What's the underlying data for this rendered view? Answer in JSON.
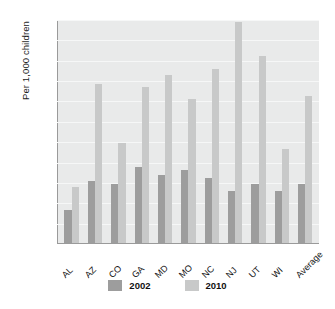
{
  "chart_data": {
    "type": "bar",
    "title": "",
    "xlabel": "",
    "ylabel": "Per 1,000 children",
    "ylim": [
      0,
      22
    ],
    "ytick_step": 2,
    "yticks": [
      "22.0",
      "20.0",
      "18.0",
      "16.0",
      "14.0",
      "12.0",
      "10.0",
      "8.0",
      "6.0",
      "4.0",
      "2.0",
      "0.0"
    ],
    "grid": true,
    "legend_position": "bottom",
    "categories": [
      "AL",
      "AZ",
      "CO",
      "GA",
      "MD",
      "MO",
      "NC",
      "NJ",
      "UT",
      "WI",
      "Average"
    ],
    "series": [
      {
        "name": "2002",
        "color": "#9d9d9d",
        "values": [
          3.3,
          6.2,
          5.9,
          7.6,
          6.8,
          7.3,
          6.5,
          5.2,
          5.9,
          5.2,
          5.9
        ]
      },
      {
        "name": "2010",
        "color": "#c8c9c9",
        "values": [
          5.6,
          15.7,
          9.9,
          15.4,
          16.6,
          14.2,
          17.2,
          21.8,
          18.5,
          9.3,
          14.5
        ]
      }
    ]
  },
  "colors": {
    "plot_background": "#e9eaea",
    "gridline": "#f6f7f7",
    "axis": "#9a9a9a",
    "text": "#111111",
    "series_2002": "#9d9d9d",
    "series_2010": "#c8c9c9"
  }
}
